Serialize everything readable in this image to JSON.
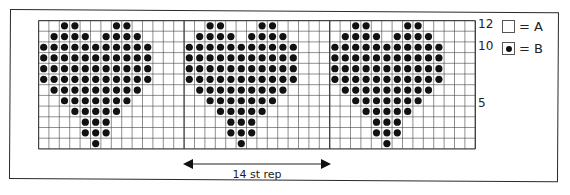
{
  "chart_data": {
    "type": "table",
    "columns_per_repeat": 14,
    "repeats_shown": 3,
    "rows": 12,
    "row_labels": [
      {
        "row": 12,
        "label": "12"
      },
      {
        "row": 10,
        "label": "10"
      },
      {
        "row": 5,
        "label": "5"
      }
    ],
    "motif_rows_top_to_bottom": [
      {
        "row": 12,
        "dot_cols": [
          2,
          3,
          7,
          8
        ]
      },
      {
        "row": 11,
        "dot_cols": [
          1,
          2,
          3,
          4,
          6,
          7,
          8,
          9
        ]
      },
      {
        "row": 10,
        "dot_cols": [
          0,
          1,
          2,
          3,
          4,
          5,
          6,
          7,
          8,
          9,
          10
        ]
      },
      {
        "row": 9,
        "dot_cols": [
          0,
          1,
          2,
          3,
          4,
          5,
          6,
          7,
          8,
          9,
          10
        ]
      },
      {
        "row": 8,
        "dot_cols": [
          0,
          1,
          2,
          3,
          4,
          5,
          6,
          7,
          8,
          9,
          10
        ]
      },
      {
        "row": 7,
        "dot_cols": [
          0,
          1,
          2,
          3,
          4,
          5,
          6,
          7,
          8,
          9,
          10
        ]
      },
      {
        "row": 6,
        "dot_cols": [
          1,
          2,
          3,
          4,
          5,
          6,
          7,
          8,
          9
        ]
      },
      {
        "row": 5,
        "dot_cols": [
          2,
          3,
          4,
          5,
          6,
          7,
          8
        ]
      },
      {
        "row": 4,
        "dot_cols": [
          3,
          4,
          5,
          6,
          7
        ]
      },
      {
        "row": 3,
        "dot_cols": [
          4,
          5,
          6
        ]
      },
      {
        "row": 2,
        "dot_cols": [
          4,
          5,
          6
        ]
      },
      {
        "row": 1,
        "dot_cols": [
          5
        ]
      }
    ],
    "legend": [
      {
        "symbol": "empty",
        "label": "= A"
      },
      {
        "symbol": "dot",
        "label": "= B"
      }
    ],
    "repeat_label": "14 st rep"
  },
  "legend": {
    "a_label": "= A",
    "b_label": "= B"
  },
  "labels": {
    "row12": "12",
    "row10": "10",
    "row5": "5",
    "repeat": "14 st rep"
  },
  "colors": {
    "grid_line": "#444444",
    "dot": "#111111",
    "background": "#ffffff"
  }
}
